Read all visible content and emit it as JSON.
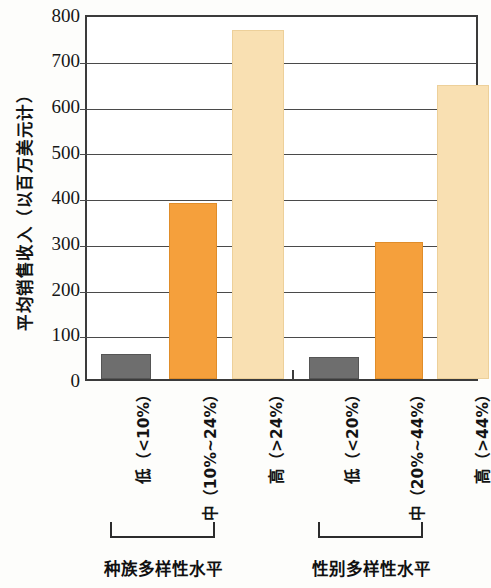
{
  "chart_data": {
    "type": "bar",
    "title": "",
    "xlabel": "",
    "ylabel": "平均销售收入（以百万美元计）",
    "ylim": [
      0,
      800
    ],
    "ytick_step": 100,
    "yticks": [
      "800",
      "700",
      "600",
      "500",
      "400",
      "300",
      "200",
      "100",
      "0"
    ],
    "grid": true,
    "legend": "none",
    "categories": [
      "低（<10%）",
      "中（10%~24%）",
      "高（>24%）",
      "低（<20%）",
      "中（20%~44%）",
      "高（>44%）"
    ],
    "values": [
      55,
      385,
      762,
      48,
      300,
      642
    ],
    "bar_colors": [
      "#6e6e6e",
      "#f5a03c",
      "#f9e0b2",
      "#6e6e6e",
      "#f5a03c",
      "#f9e0b2"
    ],
    "groups": [
      {
        "title": "种族多样性水平",
        "categories": [
          "低（<10%）",
          "中（10%~24%）",
          "高（>24%）"
        ],
        "values": [
          55,
          385,
          762
        ]
      },
      {
        "title": "性别多样性水平",
        "categories": [
          "低（<20%）",
          "中（20%~44%）",
          "高（>44%）"
        ],
        "values": [
          48,
          300,
          642
        ]
      }
    ]
  },
  "axis": {
    "y_title": "平均销售收入（以百万美元计）",
    "ticks": [
      "800",
      "700",
      "600",
      "500",
      "400",
      "300",
      "200",
      "100",
      "0"
    ]
  },
  "categories": {
    "c0": "低（<10%）",
    "c1": "中（10%~24%）",
    "c2": "高（>24%）",
    "c3": "低（<20%）",
    "c4": "中（20%~44%）",
    "c5": "高（>44%）"
  },
  "groups": {
    "g0_title": "种族多样性水平",
    "g1_title": "性别多样性水平"
  },
  "colors": {
    "low": "#6e6e6e",
    "mid": "#f5a03c",
    "high": "#f9e0b2",
    "axis": "#3b3b3b"
  }
}
